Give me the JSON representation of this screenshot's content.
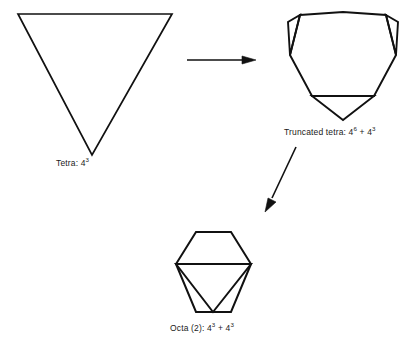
{
  "figure": {
    "background_color": "#ffffff",
    "stroke_color": "#111111"
  },
  "shapes": [
    {
      "id": "tetra",
      "name": "tetrahedron",
      "caption_base": "Tetra: 4",
      "caption_exp": "3",
      "caption_full": "Tetra: 4³",
      "description": "inverted triangle outline"
    },
    {
      "id": "truncated-tetra",
      "name": "truncated-tetrahedron",
      "caption_base": "Truncated tetra: 4",
      "caption_exp": "6",
      "caption_base2": " + 4",
      "caption_exp2": "3",
      "caption_full": "Truncated tetra: 4⁶ + 4³",
      "description": "hexagonal outline with three corner triangles"
    },
    {
      "id": "octa",
      "name": "octahedron-pair",
      "caption_base": "Octa (2): 4",
      "caption_exp": "3",
      "caption_base2": " + 4",
      "caption_exp2": "3",
      "caption_full": "Octa (2): 4³ + 4³",
      "description": "hexagon with inscribed triangle"
    }
  ],
  "arrows": [
    {
      "id": "arrow-tetra-to-trunc",
      "name": "horizontal-arrow",
      "direction": "right"
    },
    {
      "id": "arrow-trunc-to-octa",
      "name": "diagonal-arrow",
      "direction": "down-left"
    }
  ]
}
